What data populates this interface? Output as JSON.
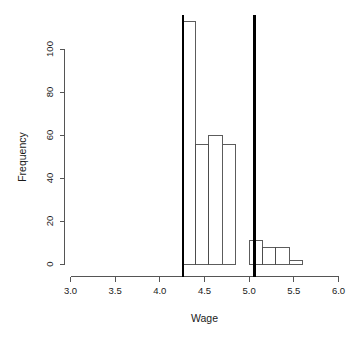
{
  "chart_data": {
    "type": "bar",
    "title": "",
    "subtitle": "",
    "xlabel": "Wage",
    "ylabel": "Frequency",
    "xlim": [
      3.0,
      6.0
    ],
    "ylim": [
      0,
      113
    ],
    "grid": false,
    "legend": null,
    "xticks": [
      "3.0",
      "3.5",
      "4.0",
      "4.5",
      "5.0",
      "5.5",
      "6.0"
    ],
    "xtick_values": [
      3.0,
      3.5,
      4.0,
      4.5,
      5.0,
      5.5,
      6.0
    ],
    "yticks": [
      "0",
      "20",
      "40",
      "60",
      "80",
      "100"
    ],
    "ytick_values": [
      0,
      20,
      40,
      60,
      80,
      100
    ],
    "bin_width": 0.15,
    "bins": [
      {
        "left": 4.25,
        "right": 4.4,
        "value": 113
      },
      {
        "left": 4.4,
        "right": 4.55,
        "value": 56
      },
      {
        "left": 4.55,
        "right": 4.7,
        "value": 60
      },
      {
        "left": 4.7,
        "right": 4.85,
        "value": 56
      },
      {
        "left": 4.85,
        "right": 5.0,
        "value": 0
      },
      {
        "left": 5.0,
        "right": 5.15,
        "value": 11
      },
      {
        "left": 5.15,
        "right": 5.3,
        "value": 8
      },
      {
        "left": 5.3,
        "right": 5.45,
        "value": 8
      },
      {
        "left": 5.45,
        "right": 5.6,
        "value": 2
      }
    ],
    "categories": [
      "4.25-4.40",
      "4.40-4.55",
      "4.55-4.70",
      "4.70-4.85",
      "4.85-5.00",
      "5.00-5.15",
      "5.15-5.30",
      "5.30-5.45",
      "5.45-5.60"
    ],
    "values": [
      113,
      56,
      60,
      56,
      0,
      11,
      8,
      8,
      2
    ],
    "annotations": [
      {
        "name": "lower-reference-line",
        "type": "vline",
        "x": 4.26
      },
      {
        "name": "upper-reference-line",
        "type": "vline",
        "x": 5.06
      }
    ],
    "colors": {
      "bar_fill": "#ffffff",
      "bar_stroke": "#4a4a4a",
      "reference_line": "#000000",
      "axis": "#555555",
      "text": "#1a1a1a",
      "background": "#ffffff"
    }
  }
}
